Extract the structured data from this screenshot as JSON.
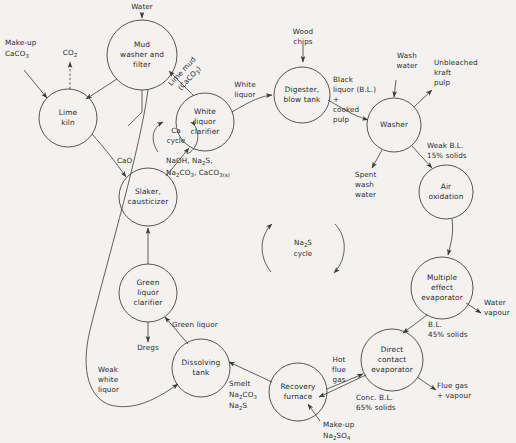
{
  "diagram": {
    "background_color": "#f3f2f0",
    "line_color": "#3a3a3a",
    "text_color": "#2b2b2b"
  },
  "nodes": [
    {
      "id": "mud-washer",
      "label_lines": [
        "Mud",
        "washer and",
        "filter"
      ],
      "cx": 142,
      "cy": 55,
      "r": 35
    },
    {
      "id": "lime-kiln",
      "label_lines": [
        "Lime",
        "kiln"
      ],
      "cx": 68,
      "cy": 118,
      "r": 29
    },
    {
      "id": "white-liquor-clar",
      "label_lines": [
        "White",
        "liquor",
        "clarifier"
      ],
      "cx": 205,
      "cy": 122,
      "r": 29
    },
    {
      "id": "slaker",
      "label_lines": [
        "Slaker,",
        "causticizer"
      ],
      "cx": 148,
      "cy": 197,
      "r": 29
    },
    {
      "id": "green-liquor-clar",
      "label_lines": [
        "Green",
        "liquor",
        "clarifier"
      ],
      "cx": 148,
      "cy": 293,
      "r": 29
    },
    {
      "id": "dissolving-tank",
      "label_lines": [
        "Dissolving",
        "tank"
      ],
      "cx": 201,
      "cy": 368,
      "r": 29
    },
    {
      "id": "recovery-furnace",
      "label_lines": [
        "Recovery",
        "furnace"
      ],
      "cx": 298,
      "cy": 392,
      "r": 29
    },
    {
      "id": "direct-contact-ev",
      "label_lines": [
        "Direct",
        "contact",
        "evaporator"
      ],
      "cx": 392,
      "cy": 360,
      "r": 31
    },
    {
      "id": "multiple-effect-ev",
      "label_lines": [
        "Multiple",
        "effect",
        "evaporator"
      ],
      "cx": 442,
      "cy": 288,
      "r": 31
    },
    {
      "id": "air-oxidation",
      "label_lines": [
        "Air",
        "oxidation"
      ],
      "cx": 446,
      "cy": 192,
      "r": 27
    },
    {
      "id": "washer",
      "label_lines": [
        "Washer"
      ],
      "cx": 394,
      "cy": 125,
      "r": 27
    },
    {
      "id": "digester",
      "label_lines": [
        "Digester,",
        "blow tank"
      ],
      "cx": 302,
      "cy": 95,
      "r": 28
    }
  ],
  "stream_labels": {
    "water": "Water",
    "co2": "CO",
    "co2_sub": "2",
    "makeup_caco3_l1": "Make-up",
    "makeup_caco3_l2": "CaCO",
    "makeup_caco3_sub": "3",
    "lime_mud_l1": "Lime mud",
    "lime_mud_l2": "(CaCO",
    "lime_mud_sub": "3",
    "lime_mud_l2b": ")",
    "white_liquor_l1": "White",
    "white_liquor_l2": "liquor",
    "wood_chips_l1": "Wood",
    "wood_chips_l2": "chips",
    "black_liquor_l1": "Black",
    "black_liquor_l2": "liquor (B.L.)",
    "black_liquor_l3": "+",
    "black_liquor_l4": "cooked",
    "black_liquor_l5": "pulp",
    "wash_water_l1": "Wash",
    "wash_water_l2": "water",
    "unbleached_l1": "Unbleached",
    "unbleached_l2": "kraft",
    "unbleached_l3": "pulp",
    "spent_wash_l1": "Spent",
    "spent_wash_l2": "wash",
    "spent_wash_l3": "water",
    "weak_bl_l1": "Weak B.L.",
    "weak_bl_l2": "15% solids",
    "water_vapour_l1": "Water",
    "water_vapour_l2": "vapour",
    "bl45_l1": "B.L.",
    "bl45_l2": "45% solids",
    "flue_gas_l1": "Flue gas",
    "flue_gas_l2": "+ vapour",
    "conc_bl_l1": "Conc. B.L.",
    "conc_bl_l2": "65% solids",
    "hot_flue_l1": "Hot",
    "hot_flue_l2": "flue",
    "hot_flue_l3": "gas",
    "makeup_na2so4_l1": "Make-up",
    "makeup_na2so4_l2a": "Na",
    "makeup_na2so4_sub1": "2",
    "makeup_na2so4_l2b": "SO",
    "makeup_na2so4_sub2": "4",
    "smelt_l1": "Smelt",
    "smelt_l2a": "Na",
    "smelt_sub1": "2",
    "smelt_l2b": "CO",
    "smelt_sub2": "3",
    "smelt_l3a": "Na",
    "smelt_sub3": "2",
    "smelt_l3b": "S",
    "green_liquor": "Green liquor",
    "dregs": "Dregs",
    "weak_white_l1": "Weak",
    "weak_white_l2": "white",
    "weak_white_l3": "liquor",
    "cao": "CaO",
    "chem_l1a": "NaOH, Na",
    "chem_sub1": "2",
    "chem_l1b": "S,",
    "chem_l2a": "Na",
    "chem_sub2": "2",
    "chem_l2b": "CO",
    "chem_sub3": "3",
    "chem_l2c": ", CaCO",
    "chem_sub4": "3(s)"
  },
  "cycles": {
    "ca_cycle_l1": "Ca",
    "ca_cycle_l2": "cycle",
    "na2s_cycle_l1a": "Na",
    "na2s_cycle_sub": "2",
    "na2s_cycle_l1b": "S",
    "na2s_cycle_l2": "cycle"
  }
}
